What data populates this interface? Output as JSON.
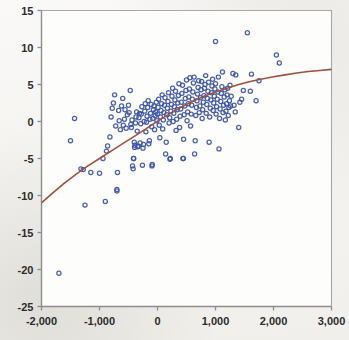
{
  "chart_data": {
    "type": "scatter",
    "title": "",
    "subtitle": "",
    "xlabel": "",
    "ylabel": "",
    "xlim": [
      -2000,
      3000
    ],
    "ylim": [
      -25,
      15
    ],
    "grid": false,
    "legend": null,
    "x_ticks": [
      -2000,
      -1000,
      0,
      1000,
      2000,
      3000
    ],
    "x_tick_labels": [
      "-2,000",
      "-1,000",
      "0",
      "1,000",
      "2,000",
      "3,000"
    ],
    "y_ticks": [
      15,
      10,
      5,
      0,
      -5,
      -10,
      -15,
      -20,
      -25
    ],
    "y_tick_labels": [
      "15",
      "10",
      "5",
      "0",
      "-5",
      "-10",
      "-15",
      "-20",
      "-25"
    ],
    "marker": {
      "shape": "open-circle",
      "color": "#3a52a8",
      "size": 4.2,
      "fill": "none"
    },
    "fit_curve": {
      "name": "logarithmic fit",
      "color": "#a0513c",
      "width": 1.6,
      "points": [
        [
          -2000,
          -11.0
        ],
        [
          -1800,
          -9.6
        ],
        [
          -1600,
          -8.3
        ],
        [
          -1400,
          -7.1
        ],
        [
          -1200,
          -6.0
        ],
        [
          -1000,
          -5.0
        ],
        [
          -800,
          -4.0
        ],
        [
          -600,
          -3.0
        ],
        [
          -400,
          -2.0
        ],
        [
          -200,
          -1.0
        ],
        [
          0,
          0.05
        ],
        [
          200,
          1.0
        ],
        [
          400,
          1.9
        ],
        [
          600,
          2.7
        ],
        [
          800,
          3.4
        ],
        [
          1000,
          4.0
        ],
        [
          1200,
          4.5
        ],
        [
          1400,
          5.0
        ],
        [
          1600,
          5.4
        ],
        [
          1800,
          5.75
        ],
        [
          2000,
          6.05
        ],
        [
          2200,
          6.3
        ],
        [
          2400,
          6.55
        ],
        [
          2600,
          6.75
        ],
        [
          2800,
          6.9
        ],
        [
          3000,
          7.05
        ]
      ]
    },
    "series": [
      {
        "name": "observations",
        "color": "#3a52a8",
        "points": [
          [
            -1700,
            -20.5
          ],
          [
            -1430,
            0.4
          ],
          [
            -1500,
            -2.6
          ],
          [
            -1320,
            -6.4
          ],
          [
            -1280,
            -6.5
          ],
          [
            -1250,
            -11.3
          ],
          [
            -1150,
            -6.9
          ],
          [
            -1000,
            -7.0
          ],
          [
            -940,
            -5.0
          ],
          [
            -900,
            -10.8
          ],
          [
            -880,
            -4.0
          ],
          [
            -860,
            -3.3
          ],
          [
            -820,
            -2.1
          ],
          [
            -800,
            0.6
          ],
          [
            -780,
            1.8
          ],
          [
            -760,
            2.5
          ],
          [
            -740,
            3.6
          ],
          [
            -720,
            -0.6
          ],
          [
            -700,
            -9.2
          ],
          [
            -700,
            -9.4
          ],
          [
            -690,
            -6.9
          ],
          [
            -670,
            1.5
          ],
          [
            -660,
            0.1
          ],
          [
            -640,
            -1.1
          ],
          [
            -620,
            2.1
          ],
          [
            -600,
            3.1
          ],
          [
            -590,
            -0.5
          ],
          [
            -570,
            0.3
          ],
          [
            -560,
            1.6
          ],
          [
            -540,
            -0.9
          ],
          [
            -520,
            0.9
          ],
          [
            -500,
            2.2
          ],
          [
            -490,
            1.2
          ],
          [
            -470,
            4.2
          ],
          [
            -460,
            -0.4
          ],
          [
            -450,
            -0.8
          ],
          [
            -440,
            0.2
          ],
          [
            -430,
            -6.0
          ],
          [
            -420,
            -6.4
          ],
          [
            -415,
            -5.0
          ],
          [
            -410,
            -5.0
          ],
          [
            -400,
            -2.8
          ],
          [
            -395,
            -3.5
          ],
          [
            -390,
            -3.2
          ],
          [
            -380,
            -0.2
          ],
          [
            -370,
            0.6
          ],
          [
            -360,
            1.3
          ],
          [
            -350,
            -1.3
          ],
          [
            -340,
            -3.4
          ],
          [
            -330,
            -3.3
          ],
          [
            -320,
            0.5
          ],
          [
            -310,
            1.1
          ],
          [
            -300,
            -2.9
          ],
          [
            -290,
            -0.3
          ],
          [
            -280,
            1.0
          ],
          [
            -270,
            2.0
          ],
          [
            -260,
            -5.9
          ],
          [
            -250,
            -3.6
          ],
          [
            -240,
            -3.1
          ],
          [
            -230,
            0.0
          ],
          [
            -220,
            1.4
          ],
          [
            -210,
            2.4
          ],
          [
            -200,
            -1.4
          ],
          [
            -190,
            -0.1
          ],
          [
            -180,
            0.7
          ],
          [
            -170,
            1.9
          ],
          [
            -160,
            2.8
          ],
          [
            -150,
            -3.0
          ],
          [
            -140,
            -2.6
          ],
          [
            -130,
            0.3
          ],
          [
            -120,
            1.1
          ],
          [
            -110,
            2.3
          ],
          [
            -100,
            -0.7
          ],
          [
            -95,
            -6.0
          ],
          [
            -90,
            -5.8
          ],
          [
            -80,
            0.4
          ],
          [
            -70,
            1.6
          ],
          [
            -60,
            2.1
          ],
          [
            -50,
            -1.1
          ],
          [
            -40,
            0.8
          ],
          [
            -30,
            1.3
          ],
          [
            -20,
            2.6
          ],
          [
            -10,
            0.1
          ],
          [
            0,
            1.0
          ],
          [
            10,
            1.9
          ],
          [
            20,
            3.0
          ],
          [
            30,
            -0.5
          ],
          [
            40,
            -2.2
          ],
          [
            50,
            0.6
          ],
          [
            60,
            1.5
          ],
          [
            70,
            2.4
          ],
          [
            80,
            3.6
          ],
          [
            90,
            -1.0
          ],
          [
            100,
            0.2
          ],
          [
            110,
            1.2
          ],
          [
            120,
            2.2
          ],
          [
            130,
            3.2
          ],
          [
            140,
            -4.4
          ],
          [
            150,
            -2.8
          ],
          [
            160,
            0.9
          ],
          [
            170,
            1.8
          ],
          [
            180,
            2.7
          ],
          [
            190,
            3.9
          ],
          [
            200,
            -0.2
          ],
          [
            210,
            0.5
          ],
          [
            215,
            -5.1
          ],
          [
            220,
            -5.0
          ],
          [
            230,
            1.4
          ],
          [
            240,
            2.3
          ],
          [
            250,
            3.4
          ],
          [
            260,
            4.5
          ],
          [
            270,
            0.0
          ],
          [
            280,
            1.1
          ],
          [
            290,
            2.0
          ],
          [
            300,
            2.9
          ],
          [
            310,
            4.1
          ],
          [
            320,
            -1.2
          ],
          [
            330,
            0.3
          ],
          [
            340,
            1.6
          ],
          [
            350,
            2.5
          ],
          [
            360,
            3.5
          ],
          [
            370,
            5.1
          ],
          [
            380,
            -0.8
          ],
          [
            390,
            0.7
          ],
          [
            400,
            1.7
          ],
          [
            410,
            2.6
          ],
          [
            420,
            3.8
          ],
          [
            430,
            4.9
          ],
          [
            440,
            -5.0
          ],
          [
            445,
            -5.0
          ],
          [
            450,
            -2.4
          ],
          [
            460,
            0.9
          ],
          [
            470,
            2.1
          ],
          [
            480,
            3.1
          ],
          [
            490,
            4.2
          ],
          [
            500,
            5.6
          ],
          [
            510,
            0.1
          ],
          [
            520,
            1.3
          ],
          [
            530,
            2.4
          ],
          [
            540,
            3.3
          ],
          [
            550,
            4.4
          ],
          [
            560,
            5.9
          ],
          [
            570,
            -0.6
          ],
          [
            580,
            1.0
          ],
          [
            590,
            2.2
          ],
          [
            600,
            3.0
          ],
          [
            610,
            4.0
          ],
          [
            620,
            5.2
          ],
          [
            630,
            6.0
          ],
          [
            640,
            -4.4
          ],
          [
            650,
            -2.6
          ],
          [
            660,
            0.8
          ],
          [
            670,
            1.9
          ],
          [
            680,
            2.8
          ],
          [
            690,
            3.7
          ],
          [
            700,
            4.6
          ],
          [
            710,
            5.5
          ],
          [
            720,
            1.2
          ],
          [
            730,
            2.1
          ],
          [
            740,
            3.2
          ],
          [
            750,
            4.3
          ],
          [
            760,
            5.4
          ],
          [
            770,
            0.4
          ],
          [
            780,
            1.6
          ],
          [
            790,
            2.6
          ],
          [
            800,
            3.5
          ],
          [
            810,
            4.5
          ],
          [
            820,
            5.0
          ],
          [
            830,
            6.2
          ],
          [
            840,
            1.1
          ],
          [
            850,
            2.3
          ],
          [
            860,
            3.1
          ],
          [
            870,
            4.1
          ],
          [
            880,
            5.3
          ],
          [
            890,
            -2.8
          ],
          [
            900,
            0.6
          ],
          [
            910,
            1.8
          ],
          [
            920,
            2.9
          ],
          [
            930,
            3.9
          ],
          [
            940,
            4.8
          ],
          [
            950,
            5.7
          ],
          [
            960,
            1.5
          ],
          [
            970,
            2.5
          ],
          [
            980,
            3.4
          ],
          [
            990,
            4.4
          ],
          [
            1000,
            10.8
          ],
          [
            1000,
            5.1
          ],
          [
            1010,
            1.0
          ],
          [
            1020,
            2.0
          ],
          [
            1030,
            3.0
          ],
          [
            1040,
            4.0
          ],
          [
            1050,
            6.0
          ],
          [
            1060,
            -3.7
          ],
          [
            1070,
            0.4
          ],
          [
            1080,
            1.7
          ],
          [
            1090,
            2.7
          ],
          [
            1100,
            3.8
          ],
          [
            1110,
            4.7
          ],
          [
            1120,
            6.7
          ],
          [
            1130,
            1.2
          ],
          [
            1140,
            2.2
          ],
          [
            1150,
            3.3
          ],
          [
            1160,
            4.3
          ],
          [
            1170,
            0.2
          ],
          [
            1180,
            1.4
          ],
          [
            1190,
            2.4
          ],
          [
            1200,
            3.6
          ],
          [
            1210,
            4.5
          ],
          [
            1220,
            0.8
          ],
          [
            1230,
            1.9
          ],
          [
            1240,
            2.8
          ],
          [
            1250,
            4.9
          ],
          [
            1260,
            2.1
          ],
          [
            1270,
            3.4
          ],
          [
            1300,
            6.5
          ],
          [
            1320,
            2.2
          ],
          [
            1340,
            1.3
          ],
          [
            1350,
            6.3
          ],
          [
            1400,
            -0.8
          ],
          [
            1420,
            2.6
          ],
          [
            1450,
            3.0
          ],
          [
            1480,
            4.2
          ],
          [
            1550,
            12.0
          ],
          [
            1600,
            4.1
          ],
          [
            1620,
            6.4
          ],
          [
            1700,
            2.8
          ],
          [
            1750,
            5.5
          ],
          [
            2050,
            9.0
          ],
          [
            2100,
            7.9
          ]
        ]
      }
    ]
  },
  "axes": {
    "frame_color": "#a8a8a8",
    "tick_color": "#8d8d8d",
    "label_color": "#2c2c2c"
  }
}
